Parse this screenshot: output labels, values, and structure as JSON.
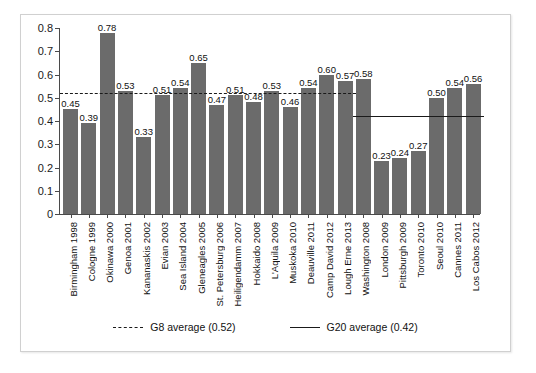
{
  "chart_data": {
    "type": "bar",
    "title": "",
    "subtitle": "",
    "xlabel": "",
    "ylabel": "",
    "ylim": [
      0,
      0.8
    ],
    "ytick_labels": [
      "0.8",
      "0.7",
      "0.6",
      "0.5",
      "0.4",
      "0.3",
      "0.2",
      "0.1",
      "0"
    ],
    "ytick_values": [
      0.8,
      0.7,
      0.6,
      0.5,
      0.4,
      0.3,
      0.2,
      0.1,
      0
    ],
    "grid": false,
    "legend_position": "bottom",
    "bar_color": "#6b6b6b",
    "categories": [
      "Birmingham 1998",
      "Cologne 1999",
      "Okinawa 2000",
      "Genoa 2001",
      "Kananaskis 2002",
      "Evian 2003",
      "Sea Island 2004",
      "Gleneagles 2005",
      "St. Petersburg 2006",
      "Heiligendamm 2007",
      "Hokkaido 2008",
      "L'Aquila 2009",
      "Muskoka 2010",
      "Deauville 2011",
      "Camp David 2012",
      "Lough Erne 2013",
      "Washington 2008",
      "London 2009",
      "Pittsburgh 2009",
      "Toronto 2010",
      "Seoul 2010",
      "Cannes 2011",
      "Los Cabos 2012"
    ],
    "values": [
      0.45,
      0.39,
      0.78,
      0.53,
      0.33,
      0.51,
      0.54,
      0.65,
      0.47,
      0.51,
      0.48,
      0.53,
      0.46,
      0.54,
      0.6,
      0.57,
      0.58,
      0.23,
      0.24,
      0.27,
      0.5,
      0.54,
      0.56
    ],
    "value_labels": [
      "0.45",
      "0.39",
      "0.78",
      "0.53",
      "0.33",
      "0.51",
      "0.54",
      "0.65",
      "0.47",
      "0.51",
      "0.48",
      "0.53",
      "0.46",
      "0.54",
      "0.60",
      "0.57",
      "0.58",
      "0.23",
      "0.24",
      "0.27",
      "0.50",
      "0.54",
      "0.56"
    ],
    "reference_lines": [
      {
        "name": "g8-average",
        "label": "G8 average (0.52)",
        "value": 0.52,
        "style": "dashed",
        "color": "#1a1a1a",
        "span_start_index": 0,
        "span_end_index": 15
      },
      {
        "name": "g20-average",
        "label": "G20 average (0.42)",
        "value": 0.42,
        "style": "solid",
        "color": "#1a1a1a",
        "span_start_index": 16,
        "span_end_index": 22
      }
    ]
  },
  "legend": {
    "items": [
      {
        "label": "G8 average (0.52)",
        "style": "dashed"
      },
      {
        "label": "G20 average (0.42)",
        "style": "solid"
      }
    ]
  }
}
